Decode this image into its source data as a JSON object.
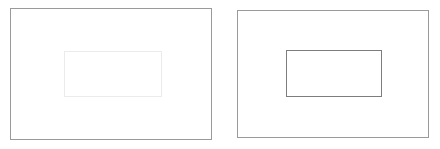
{
  "figure": {
    "type": "diagram",
    "title": "",
    "background_color": "#ffffff",
    "width": 440,
    "height": 149
  },
  "panels": [
    {
      "id": "left",
      "name": "left-panel",
      "label": "",
      "outer_rect": {
        "name": "outer-rectangle",
        "x": 10,
        "y": 8,
        "width": 202,
        "height": 132,
        "stroke_color": "#9a9a9a",
        "stroke_width": 1,
        "fill": "#ffffff"
      },
      "inner_rect": {
        "name": "inner-rectangle",
        "x": 64,
        "y": 51,
        "width": 98,
        "height": 46,
        "stroke_color": "#ebebeb",
        "stroke_width": 1,
        "fill": "#ffffff"
      }
    },
    {
      "id": "right",
      "name": "right-panel",
      "label": "",
      "outer_rect": {
        "name": "outer-rectangle",
        "x": 237,
        "y": 10,
        "width": 192,
        "height": 128,
        "stroke_color": "#9a9a9a",
        "stroke_width": 1,
        "fill": "#ffffff"
      },
      "inner_rect": {
        "name": "inner-rectangle",
        "x": 286,
        "y": 50,
        "width": 96,
        "height": 47,
        "stroke_color": "#7d7d7d",
        "stroke_width": 1,
        "fill": "#ffffff"
      }
    }
  ],
  "colors": {
    "outer_border": "#9a9a9a",
    "inner_border_faint": "#ebebeb",
    "inner_border_dark": "#7d7d7d",
    "background": "#ffffff"
  }
}
